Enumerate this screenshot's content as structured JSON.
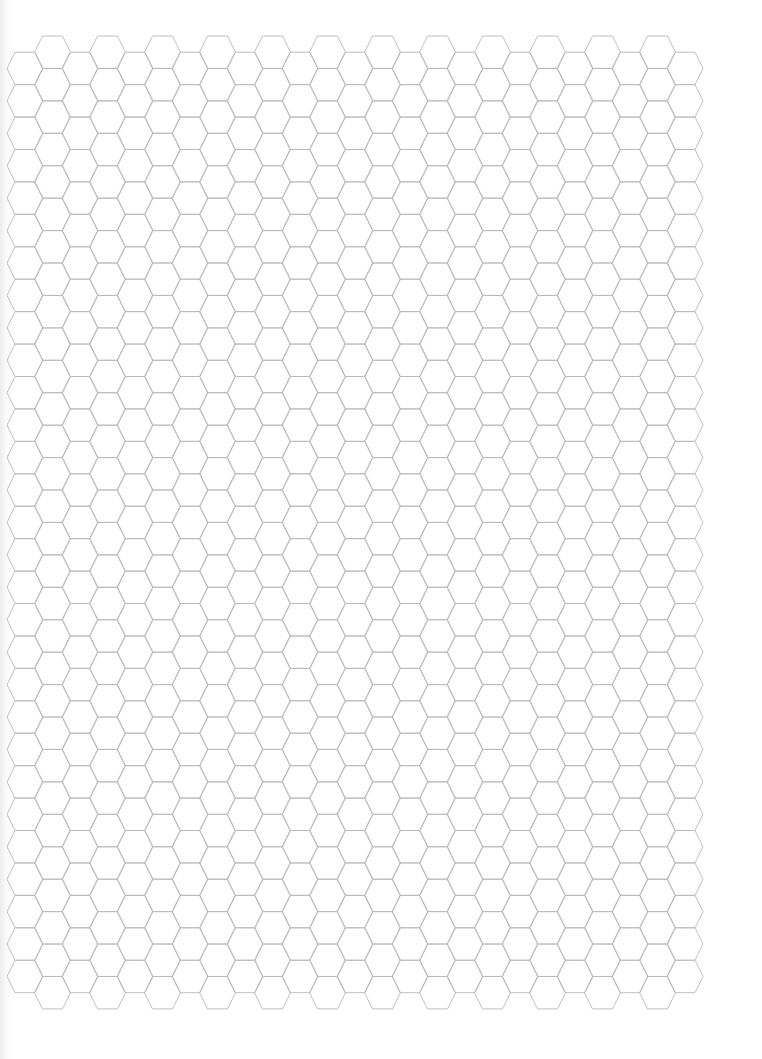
{
  "page": {
    "type": "hexagonal graph paper",
    "background_color": "#ffffff",
    "line_color": "#b9b9b9",
    "line_width": 0.9
  },
  "grid": {
    "orientation": "flat-top",
    "columns": 25,
    "first_column_center_x": 25,
    "column_spacing": 27.5,
    "hex_half_width": 18,
    "top_edge_half_length": 10,
    "row_period": 32.43,
    "odd_column_top_y": 36,
    "even_column_top_y": 52.2,
    "odd_column_rows": 30,
    "even_column_rows": 29
  }
}
